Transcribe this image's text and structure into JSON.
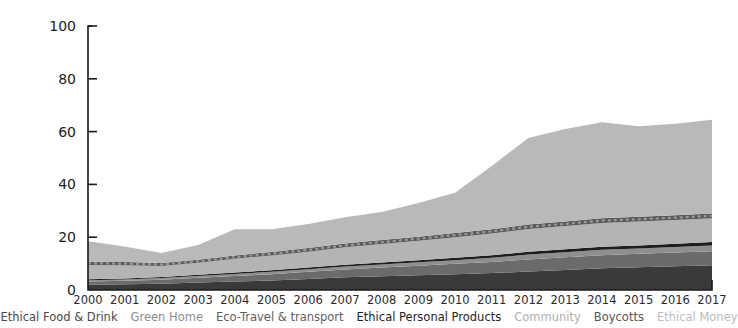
{
  "chart_data": {
    "type": "area",
    "title": "",
    "xlabel": "",
    "ylabel": "",
    "stacked": true,
    "grid": false,
    "legend_position": "bottom",
    "ylim": [
      0,
      100
    ],
    "yticks": [
      0,
      20,
      40,
      60,
      80,
      100
    ],
    "x": [
      2000,
      2001,
      2002,
      2003,
      2004,
      2005,
      2006,
      2007,
      2008,
      2009,
      2010,
      2011,
      2012,
      2013,
      2014,
      2015,
      2016,
      2017
    ],
    "categories": [
      "2000",
      "2001",
      "2002",
      "2003",
      "2004",
      "2005",
      "2006",
      "2007",
      "2008",
      "2009",
      "2010",
      "2011",
      "2012",
      "2013",
      "2014",
      "2015",
      "2016",
      "2017"
    ],
    "series": [
      {
        "name": "Ethical Food & Drink",
        "color": "#3a3a3a",
        "values": [
          2.0,
          2.2,
          2.4,
          2.8,
          3.2,
          3.6,
          4.2,
          4.8,
          5.2,
          5.6,
          6.0,
          6.4,
          7.0,
          7.6,
          8.2,
          8.6,
          9.0,
          9.4
        ]
      },
      {
        "name": "Green Home",
        "color": "#6b6b6b",
        "values": [
          1.2,
          1.3,
          1.5,
          1.8,
          2.1,
          2.4,
          2.7,
          3.0,
          3.3,
          3.6,
          3.9,
          4.2,
          4.6,
          4.8,
          5.0,
          5.1,
          5.2,
          5.3
        ]
      },
      {
        "name": "Eco-Travel & transport",
        "color": "#8f8f8f",
        "values": [
          0.5,
          0.5,
          0.6,
          0.7,
          0.8,
          0.9,
          1.0,
          1.1,
          1.2,
          1.3,
          1.4,
          1.6,
          1.8,
          1.9,
          2.0,
          2.0,
          2.1,
          2.2
        ]
      },
      {
        "name": "Ethical Personal Products",
        "color": "#1e1e1e",
        "values": [
          0.4,
          0.4,
          0.4,
          0.5,
          0.5,
          0.6,
          0.6,
          0.7,
          0.7,
          0.8,
          0.9,
          1.0,
          1.1,
          1.1,
          1.2,
          1.2,
          1.2,
          1.3
        ]
      },
      {
        "name": "Community",
        "color": "#b4b4b4",
        "values": [
          5.4,
          5.0,
          4.2,
          4.5,
          5.2,
          5.6,
          6.0,
          6.6,
          7.0,
          7.4,
          7.8,
          8.2,
          8.6,
          8.8,
          9.0,
          9.0,
          9.0,
          9.0
        ]
      },
      {
        "name": "Boycotts",
        "color": "#5a5a5a",
        "values": [
          1.2,
          1.2,
          1.1,
          1.2,
          1.3,
          1.3,
          1.4,
          1.4,
          1.5,
          1.5,
          1.6,
          1.6,
          1.7,
          1.7,
          1.8,
          1.8,
          1.8,
          1.8
        ]
      },
      {
        "name": "Ethical Money",
        "color": "#b9b9b9",
        "values": [
          7.8,
          5.9,
          3.8,
          5.5,
          9.9,
          8.6,
          9.1,
          10.0,
          10.6,
          12.8,
          15.2,
          24.0,
          32.8,
          35.1,
          36.3,
          34.3,
          34.7,
          35.5
        ]
      }
    ],
    "totals": [
      18.5,
      16.5,
      14.0,
      17.0,
      23.0,
      23.0,
      25.0,
      27.6,
      29.5,
      33.0,
      36.8,
      47.0,
      57.6,
      61.0,
      63.5,
      62.0,
      63.0,
      64.5
    ]
  },
  "axis": {
    "y_ticks": [
      "0",
      "20",
      "40",
      "60",
      "80",
      "100"
    ],
    "x_ticks": [
      "2000",
      "2001",
      "2002",
      "2003",
      "2004",
      "2005",
      "2006",
      "2007",
      "2008",
      "2009",
      "2010",
      "2011",
      "2012",
      "2013",
      "2014",
      "2015",
      "2016",
      "2017"
    ]
  },
  "legend": {
    "items": [
      {
        "label": "Ethical Food & Drink",
        "color": "#4a4a4a"
      },
      {
        "label": "Green Home",
        "color": "#8e8e8e"
      },
      {
        "label": "Eco-Travel & transport",
        "color": "#5e5e5e"
      },
      {
        "label": "Ethical Personal Products",
        "color": "#232323"
      },
      {
        "label": "Community",
        "color": "#b0b0b0"
      },
      {
        "label": "Boycotts",
        "color": "#555555"
      },
      {
        "label": "Ethical Money",
        "color": "#bdbdbd"
      }
    ]
  }
}
